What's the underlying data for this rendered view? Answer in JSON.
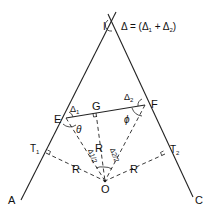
{
  "diagram": {
    "title_formula": {
      "delta": "Δ",
      "equals": " = (",
      "d1": "Δ",
      "d1_sub": "1",
      "plus": " + ",
      "d2": "Δ",
      "d2_sub": "2",
      "close": ")"
    },
    "points": {
      "I": "I",
      "A": "A",
      "C": "C",
      "E": "E",
      "F": "F",
      "G": "G",
      "O": "O",
      "T1": "T",
      "T1_sub": "1",
      "T2": "T",
      "T2_sub": "2"
    },
    "angles": {
      "delta1": "Δ",
      "delta1_sub": "1",
      "delta2": "Δ",
      "delta2_sub": "2",
      "theta": "θ",
      "phi": "ϕ",
      "half_delta1": "Δ1/2",
      "half_delta2": "Δ2/2"
    },
    "radius_labels": {
      "R_center": "R",
      "R_left": "R",
      "R_right": "R"
    }
  }
}
